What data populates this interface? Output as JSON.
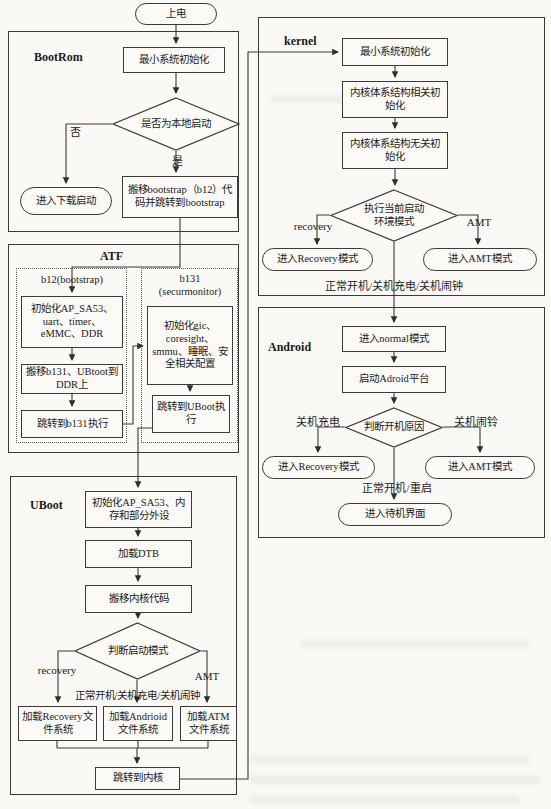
{
  "flow": {
    "power_on": "上电",
    "bootrom": {
      "title": "BootRom",
      "min_sys_init": "最小系统初始化",
      "is_local_boot": "是否为本地启动",
      "no_label": "否",
      "yes_label": "是",
      "enter_download": "进入下载启动",
      "move_bootstrap": "搬移bootstrap（b12）代码并跳转到bootstrap"
    },
    "atf": {
      "title": "ATF",
      "b12_title": "b12(bootstrap)",
      "init_ap": "初始化AP_SA53、uart、timer、eMMC、DDR",
      "move_b131": "搬移b131、UBtoot到DDR上",
      "jump_b131": "跳转到b131执行",
      "b131_title": "b131",
      "b131_subtitle": "(securmonitor)",
      "init_gic": "初始化gic、coresight、smmu、睡眠、安全相关配置",
      "jump_uboot": "跳转到UBoot执行"
    },
    "uboot": {
      "title": "UBoot",
      "init_ap_mem": "初始化AP_SA53、内存和部分外设",
      "load_dtb": "加载DTB",
      "move_kernel_code": "搬移内核代码",
      "judge_boot_mode": "判断启动模式",
      "recovery_label": "recovery",
      "amt_label": "AMT",
      "normal_label": "正常开机/关机充电/关机闹钟",
      "load_recovery": "加载Recovery文件系统",
      "load_android": "加载Andrioid文件系统",
      "load_atm": "加载ATM文件系统",
      "jump_kernel": "跳转到内核"
    },
    "kernel": {
      "title": "kernel",
      "min_sys_init": "最小系统初始化",
      "arch_related_init": "内核体系结构相关初始化",
      "arch_unrelated_init": "内核体系结构无关初始化",
      "exec_boot_env": "执行当前启动环境模式",
      "recovery_label": "recovery",
      "amt_label": "AMT",
      "enter_recovery": "进入Recovery模式",
      "enter_amt": "进入AMT模式",
      "normal_label": "正常开机/关机充电/关机闹钟"
    },
    "android": {
      "title": "Android",
      "enter_normal": "进入normal模式",
      "start_adroid": "启动Adroid平台",
      "judge_power_reason": "判断开机原因",
      "poweroff_charge": "关机充电",
      "poweroff_alarm": "关机闹铃",
      "enter_recovery": "进入Recovery模式",
      "enter_amt": "进入AMT模式",
      "normal_reboot": "正常开机/重启",
      "enter_standby": "进入待机界面"
    }
  },
  "colors": {
    "line": "#3a3a3a",
    "text": "#1c1c1c",
    "paper": "#faf9f6"
  }
}
